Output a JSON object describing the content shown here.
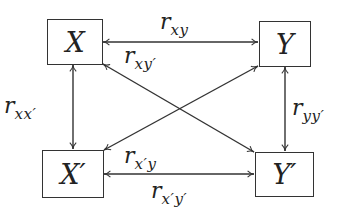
{
  "diagram": {
    "type": "correlation-diagram",
    "line_color": "#333333",
    "nodes": [
      {
        "id": "X",
        "label": "X"
      },
      {
        "id": "Y",
        "label": "Y"
      },
      {
        "id": "Xp",
        "label": "X′"
      },
      {
        "id": "Yp",
        "label": "Y′"
      }
    ],
    "edges": [
      {
        "from": "X",
        "to": "Y",
        "label_r": "r",
        "label_sub": "xy",
        "bidirectional": true
      },
      {
        "from": "X",
        "to": "Yp",
        "label_r": "r",
        "label_sub": "xy′",
        "bidirectional": true
      },
      {
        "from": "X",
        "to": "Xp",
        "label_r": "r",
        "label_sub": "xx′",
        "bidirectional": true
      },
      {
        "from": "Y",
        "to": "Yp",
        "label_r": "r",
        "label_sub": "yy′",
        "bidirectional": true
      },
      {
        "from": "Xp",
        "to": "Y",
        "label_r": "r",
        "label_sub": "x′y",
        "bidirectional": true
      },
      {
        "from": "Xp",
        "to": "Yp",
        "label_r": "r",
        "label_sub": "x′y′",
        "bidirectional": true
      }
    ]
  }
}
